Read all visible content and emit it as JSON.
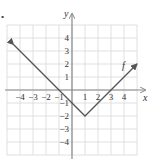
{
  "chart_data": {
    "type": "line",
    "title": "",
    "xlabel": "x",
    "ylabel": "y",
    "xlim": [
      -5,
      5
    ],
    "ylim": [
      -5,
      5
    ],
    "grid": true,
    "x_ticks": [
      -4,
      -3,
      -2,
      -1,
      1,
      2,
      3,
      4
    ],
    "y_ticks": [
      4,
      3,
      2,
      1,
      -1,
      -2,
      -3,
      -4
    ],
    "x_tick_labels": [
      "−4",
      "−3",
      "−2",
      "−1",
      "1",
      "2",
      "3",
      "4"
    ],
    "y_tick_labels": [
      "4",
      "3",
      "2",
      "1",
      "−1",
      "−2",
      "−3",
      "−4"
    ],
    "series": [
      {
        "name": "f",
        "equation": "f(x) = |x - 1| - 2",
        "x": [
          -4.5,
          -1,
          0,
          1,
          3,
          5
        ],
        "y": [
          3.5,
          0,
          -1,
          -2,
          0,
          2
        ],
        "arrows_at_ends": true,
        "vertex": [
          1,
          -2
        ]
      }
    ],
    "annotations": [
      {
        "text": "f",
        "x": 4.0,
        "y": 1.6
      }
    ]
  },
  "labels": {
    "x_axis": "x",
    "y_axis": "y",
    "curve": "f",
    "bullet": "•"
  },
  "colors": {
    "axis": "#888888",
    "grid": "#d8d8d8",
    "curve": "#555555",
    "text": "#333333"
  }
}
